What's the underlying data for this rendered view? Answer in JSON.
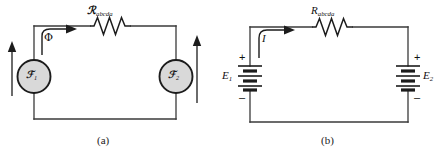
{
  "figure": {
    "background_color": "#ffffff",
    "line_color": "#3a3a3a",
    "ink_color": "#111111",
    "circle_fill": "#d9d9d9",
    "circle_stroke": "#1c1c1c"
  },
  "panels": [
    {
      "id": "a",
      "caption": "(a)",
      "type": "magnetic-circuit",
      "resistor": {
        "symbol": "ℛ",
        "subscript": "abcda",
        "name": "reluctance-resistor"
      },
      "sources": [
        {
          "symbol": "ℱ",
          "subscript": "1",
          "name": "mmf-source-1"
        },
        {
          "symbol": "ℱ",
          "subscript": "2",
          "name": "mmf-source-2"
        }
      ],
      "flux": {
        "label": "Φ",
        "direction": "clockwise"
      },
      "arrows": [
        {
          "name": "flux-arrow-left",
          "direction": "up"
        },
        {
          "name": "flux-arrow-right",
          "direction": "up"
        }
      ]
    },
    {
      "id": "b",
      "caption": "(b)",
      "type": "electric-circuit",
      "resistor": {
        "symbol": "R",
        "subscript": "abcda",
        "name": "resistor"
      },
      "current": {
        "label": "I",
        "direction": "clockwise"
      },
      "batteries": [
        {
          "label": "E",
          "subscript": "1",
          "plus": "+",
          "minus": "–",
          "name": "battery-e1"
        },
        {
          "label": "E",
          "subscript": "2",
          "plus": "+",
          "minus": "–",
          "name": "battery-e2"
        }
      ]
    }
  ]
}
